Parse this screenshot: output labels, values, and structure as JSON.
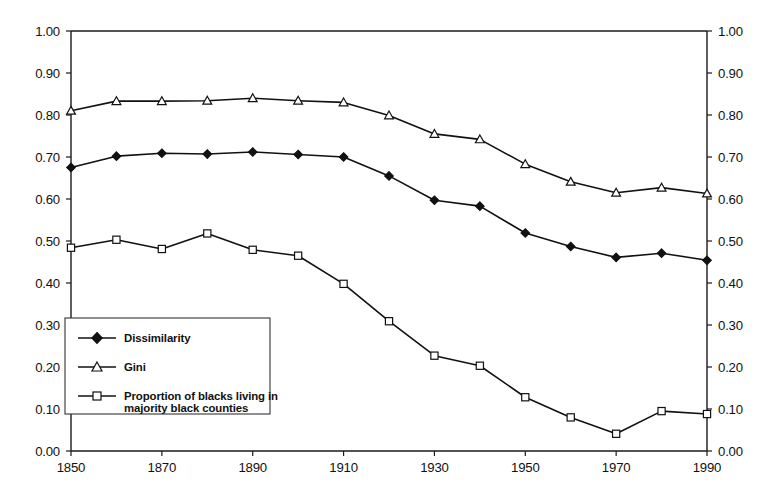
{
  "chart_data": {
    "type": "line",
    "title": "",
    "subtitle": "",
    "xlabel": "",
    "ylabel": "",
    "xlim": [
      1850,
      1990
    ],
    "ylim": [
      0.0,
      1.0
    ],
    "grid": false,
    "legend_position": "lower-left",
    "x": [
      1850,
      1860,
      1870,
      1880,
      1890,
      1900,
      1910,
      1920,
      1930,
      1940,
      1950,
      1960,
      1970,
      1980,
      1990
    ],
    "xticks": [
      "1850",
      "1870",
      "1890",
      "1910",
      "1930",
      "1950",
      "1970",
      "1990"
    ],
    "xtick_values": [
      1850,
      1870,
      1890,
      1910,
      1930,
      1950,
      1970,
      1990
    ],
    "yticks": [
      "0.00",
      "0.10",
      "0.20",
      "0.30",
      "0.40",
      "0.50",
      "0.60",
      "0.70",
      "0.80",
      "0.90",
      "1.00"
    ],
    "ytick_values": [
      0.0,
      0.1,
      0.2,
      0.3,
      0.4,
      0.5,
      0.6,
      0.7,
      0.8,
      0.9,
      1.0
    ],
    "right_axis_yticks": [
      "0.00",
      "0.10",
      "0.20",
      "0.30",
      "0.40",
      "0.50",
      "0.60",
      "0.70",
      "0.80",
      "0.90",
      "1.00"
    ],
    "series": [
      {
        "name": "Dissimilarity",
        "marker": "filled-diamond",
        "color": "#111111",
        "values": [
          0.675,
          0.702,
          0.709,
          0.707,
          0.712,
          0.706,
          0.7,
          0.655,
          0.597,
          0.583,
          0.519,
          0.487,
          0.461,
          0.471,
          0.454
        ]
      },
      {
        "name": "Gini",
        "marker": "open-triangle",
        "color": "#111111",
        "values": [
          0.81,
          0.833,
          0.833,
          0.834,
          0.84,
          0.834,
          0.83,
          0.799,
          0.755,
          0.742,
          0.683,
          0.641,
          0.615,
          0.627,
          0.613
        ]
      },
      {
        "name": "Proportion of blacks living in majority black counties",
        "marker": "open-square",
        "color": "#111111",
        "values": [
          0.484,
          0.503,
          0.481,
          0.518,
          0.479,
          0.465,
          0.398,
          0.309,
          0.227,
          0.203,
          0.128,
          0.08,
          0.041,
          0.095,
          0.088
        ]
      }
    ]
  },
  "legend": {
    "items": [
      {
        "label": "Dissimilarity",
        "label2": "",
        "marker": "filled-diamond"
      },
      {
        "label": "Gini",
        "label2": "",
        "marker": "open-triangle"
      },
      {
        "label": "Proportion of blacks living in",
        "label2": "majority black counties",
        "marker": "open-square"
      }
    ]
  },
  "colors": {
    "axis": "#1a1a1a",
    "line": "#111111",
    "background": "#ffffff",
    "legend_border": "#333333"
  }
}
